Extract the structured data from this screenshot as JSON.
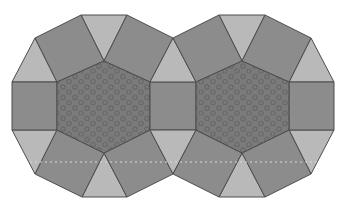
{
  "diagram": {
    "colors": {
      "background": "#ffffff",
      "square": "#8c8c8c",
      "triangle": "#b9b9b9",
      "hexagon": "#7b7b7b",
      "hexagon_dot": "#676767",
      "edge": "#4d4d4d",
      "fold_line": "#d8d8d8"
    },
    "figures": [
      {
        "name": "left",
        "hexagon_center": [
          103.5,
          106
        ]
      },
      {
        "name": "right",
        "hexagon_center": [
          242.5,
          106
        ]
      }
    ],
    "shared_square": "middle"
  }
}
